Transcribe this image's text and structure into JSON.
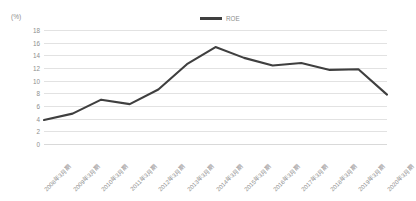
{
  "axis_unit_label": "(%)",
  "legend": {
    "entries": [
      {
        "label": "ROE",
        "color": "#3f3f3f",
        "marker": "line-swatch"
      }
    ]
  },
  "chart_data": {
    "type": "line",
    "title": "",
    "xlabel": "",
    "ylabel": "(%)",
    "ylim": [
      0,
      18
    ],
    "ytick_step": 2,
    "yticks": [
      0,
      2,
      4,
      6,
      8,
      10,
      12,
      14,
      16,
      18
    ],
    "grid": true,
    "legend_position": "top-center",
    "categories": [
      "2008年3月期",
      "2009年3月期",
      "2010年3月期",
      "2011年3月期",
      "2012年3月期",
      "2013年3月期",
      "2014年3月期",
      "2015年3月期",
      "2016年3月期",
      "2017年3月期",
      "2018年3月期",
      "2019年3月期",
      "2020年3月期"
    ],
    "series": [
      {
        "name": "ROE",
        "color": "#3f3f3f",
        "values": [
          3.8,
          4.8,
          7.0,
          6.3,
          8.6,
          12.6,
          15.3,
          13.6,
          12.4,
          12.8,
          11.7,
          11.8,
          7.8
        ]
      }
    ]
  },
  "style": {
    "line_color": "#3f3f3f",
    "grid_color": "#e2e2e2",
    "text_color": "#8d8d8d",
    "background": "#ffffff"
  }
}
